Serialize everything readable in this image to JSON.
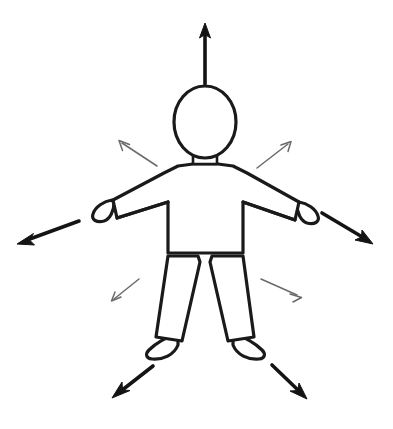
{
  "image": {
    "title": "Outline human figure with radiating directional arrows",
    "background_color": "#ffffff",
    "width": 393,
    "height": 429
  },
  "colors": {
    "outline": "#1a1a1a",
    "arrow_thick": "#141414",
    "arrow_thin": "#6a6a6a",
    "fill": "#ffffff"
  },
  "figure": {
    "name": "human-figure",
    "parts": [
      {
        "name": "head",
        "label": "Head"
      },
      {
        "name": "neck",
        "label": "Neck"
      },
      {
        "name": "torso",
        "label": "Torso"
      },
      {
        "name": "left-arm",
        "label": "Left arm"
      },
      {
        "name": "right-arm",
        "label": "Right arm"
      },
      {
        "name": "left-hand",
        "label": "Left hand"
      },
      {
        "name": "right-hand",
        "label": "Right hand"
      },
      {
        "name": "left-leg",
        "label": "Left leg"
      },
      {
        "name": "right-leg",
        "label": "Right leg"
      },
      {
        "name": "left-foot",
        "label": "Left foot"
      },
      {
        "name": "right-foot",
        "label": "Right foot"
      }
    ]
  },
  "arrows": {
    "count": 9,
    "thick": [
      {
        "name": "arrow-up",
        "label": "Up",
        "direction": "up",
        "x1": 205,
        "y1": 84,
        "x2": 205,
        "y2": 24
      },
      {
        "name": "arrow-left",
        "label": "Left",
        "direction": "down-left",
        "x1": 79,
        "y1": 221,
        "x2": 19,
        "y2": 243
      },
      {
        "name": "arrow-right",
        "label": "Right",
        "direction": "down-right",
        "x1": 322,
        "y1": 213,
        "x2": 372,
        "y2": 243
      },
      {
        "name": "arrow-down-left",
        "label": "Down left",
        "direction": "down-left",
        "x1": 153,
        "y1": 366,
        "x2": 114,
        "y2": 397
      },
      {
        "name": "arrow-down-right",
        "label": "Down right",
        "direction": "down-right",
        "x1": 272,
        "y1": 365,
        "x2": 306,
        "y2": 398
      }
    ],
    "thin": [
      {
        "name": "arrow-upper-left",
        "label": "Upper left",
        "direction": "up-left",
        "x1": 157,
        "y1": 166,
        "x2": 119,
        "y2": 141
      },
      {
        "name": "arrow-upper-right",
        "label": "Upper right",
        "direction": "up-right",
        "x1": 257,
        "y1": 168,
        "x2": 291,
        "y2": 142
      },
      {
        "name": "arrow-lower-left",
        "label": "Lower left",
        "direction": "down-left",
        "x1": 139,
        "y1": 279,
        "x2": 111,
        "y2": 301
      },
      {
        "name": "arrow-lower-right",
        "label": "Lower right",
        "direction": "down-right",
        "x1": 261,
        "y1": 279,
        "x2": 301,
        "y2": 297
      }
    ]
  }
}
